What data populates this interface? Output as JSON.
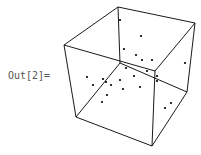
{
  "cell": {
    "output_label": "Out[2]="
  },
  "graphics3d": {
    "type": "point-plot-3d-box",
    "box_color": "#000000",
    "point_color": "#000000",
    "vertices": {
      "A": [
        64,
        45
      ],
      "B": [
        118,
        7
      ],
      "C": [
        195,
        23
      ],
      "D": [
        155,
        71
      ],
      "E": [
        76,
        117
      ],
      "F": [
        120,
        63
      ],
      "G": [
        187,
        92
      ],
      "H": [
        152,
        146
      ]
    },
    "edges": [
      [
        "A",
        "B"
      ],
      [
        "B",
        "C"
      ],
      [
        "C",
        "D"
      ],
      [
        "D",
        "A"
      ],
      [
        "A",
        "E"
      ],
      [
        "B",
        "F"
      ],
      [
        "C",
        "G"
      ],
      [
        "D",
        "H"
      ],
      [
        "E",
        "F"
      ],
      [
        "F",
        "G"
      ],
      [
        "E",
        "H"
      ],
      [
        "G",
        "H"
      ]
    ],
    "points": [
      [
        120,
        20
      ],
      [
        141,
        36
      ],
      [
        124,
        49
      ],
      [
        136,
        55
      ],
      [
        142,
        60
      ],
      [
        152,
        60
      ],
      [
        185,
        63
      ],
      [
        126,
        68
      ],
      [
        147,
        71
      ],
      [
        157,
        76
      ],
      [
        157,
        81
      ],
      [
        134,
        76
      ],
      [
        87,
        77
      ],
      [
        93,
        85
      ],
      [
        103,
        79
      ],
      [
        106,
        82
      ],
      [
        111,
        85
      ],
      [
        120,
        80
      ],
      [
        123,
        89
      ],
      [
        107,
        95
      ],
      [
        102,
        102
      ],
      [
        140,
        87
      ],
      [
        165,
        108
      ],
      [
        171,
        103
      ]
    ]
  }
}
